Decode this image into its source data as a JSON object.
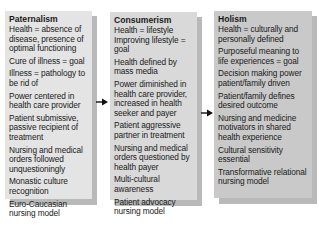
{
  "columns": [
    {
      "title": "Paternalism",
      "items": [
        "Health = absence of disease, presence of optimal functioning",
        "Cure of illness = goal",
        "Illness  = pathology to be rid of",
        "Power centered in health care provider",
        "Patient submissive, passive recipient of treatment",
        "Nursing and medical orders followed unquestioningly",
        "Monastic culture recognition",
        "Euro-Caucasian nursing model"
      ]
    },
    {
      "title": "Consumerism",
      "items": [
        "Health = lifestyle",
        "Improving lifestyle = goal",
        "Health defined by mass media",
        "Power diminished in health care provider, increased in health seeker and payer",
        "Patient aggressive partner in treatment",
        "Nursing and medical orders questioned by health payer",
        "Multi-cultural awareness",
        "Patient advocacy nursing model"
      ]
    },
    {
      "title": "Holism",
      "items": [
        "Health = culturally and personally defined",
        "Purposeful meaning to life experiences = goal",
        "Decision making power patient/family driven",
        "Patient/family defines desired outcome",
        "Nursing and medicine motivators in shared health experience",
        "Cultural sensitivity essential",
        "Transformative relational nursing model"
      ]
    }
  ],
  "arrows": [
    {
      "from": "Paternalism",
      "to": "Consumerism",
      "icon": "arrow-right-icon"
    },
    {
      "from": "Consumerism",
      "to": "Holism",
      "icon": "arrow-right-icon"
    }
  ],
  "colors": {
    "box1": "#e4e4e4",
    "box2": "#d9d9d9",
    "box3": "#c9c9c9",
    "shadow": "#b9b9b9",
    "arrow": "#111111"
  }
}
